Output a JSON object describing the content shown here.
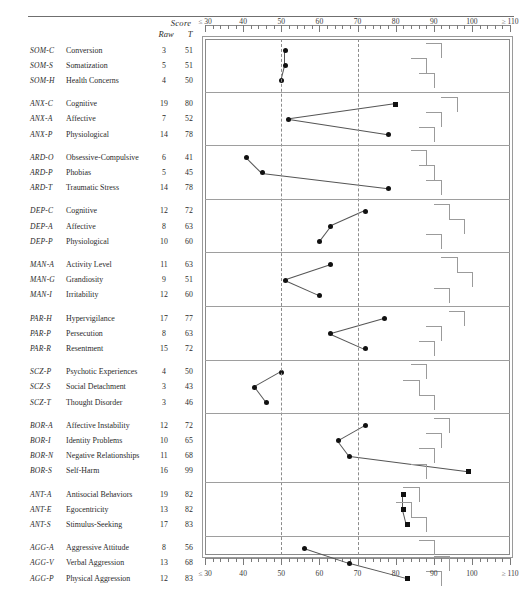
{
  "header": {
    "score_label": "Score",
    "raw_label": "Raw",
    "t_label": "T"
  },
  "axis": {
    "ticks": [
      {
        "label": "≤ 30",
        "value": 30
      },
      {
        "label": "40",
        "value": 40
      },
      {
        "label": "50",
        "value": 50
      },
      {
        "label": "60",
        "value": 60
      },
      {
        "label": "70",
        "value": 70
      },
      {
        "label": "80",
        "value": 80
      },
      {
        "label": "90",
        "value": 90
      },
      {
        "label": "100",
        "value": 100
      },
      {
        "label": "≥ 110",
        "value": 110
      }
    ],
    "reference_lines": [
      50,
      70
    ],
    "min": 30,
    "max": 110
  },
  "chart_data": {
    "type": "line",
    "xlabel": "T score",
    "ylabel": "",
    "xlim": [
      30,
      110
    ],
    "grid": true,
    "legend": "none",
    "marker_rule": "circle below T=80, square at or above T=80",
    "categories": [
      "Conversion",
      "Somatization",
      "Health Concerns",
      "Cognitive",
      "Affective",
      "Physiological",
      "Obsessive-Compulsive",
      "Phobias",
      "Traumatic Stress",
      "Cognitive",
      "Affective",
      "Physiological",
      "Activity Level",
      "Grandiosity",
      "Irritability",
      "Hypervigilance",
      "Persecution",
      "Resentment",
      "Psychotic Experiences",
      "Social Detachment",
      "Thought Disorder",
      "Affective Instability",
      "Identity Problems",
      "Negative Relationships",
      "Self-Harm",
      "Antisocial Behaviors",
      "Egocentricity",
      "Stimulus-Seeking",
      "Aggressive Attitude",
      "Verbal Aggression",
      "Physical Aggression"
    ],
    "values": [
      51,
      51,
      50,
      80,
      52,
      78,
      41,
      45,
      78,
      72,
      63,
      60,
      63,
      51,
      60,
      77,
      63,
      72,
      50,
      43,
      46,
      72,
      65,
      68,
      99,
      82,
      82,
      83,
      56,
      68,
      83
    ],
    "raw_values": [
      3,
      5,
      4,
      19,
      7,
      14,
      6,
      5,
      14,
      12,
      8,
      10,
      11,
      9,
      12,
      17,
      8,
      15,
      4,
      3,
      3,
      12,
      10,
      11,
      16,
      19,
      13,
      17,
      8,
      13,
      12
    ],
    "groups": [
      {
        "group_code": "SOM",
        "rows": [
          {
            "code": "SOM-C",
            "name": "Conversion",
            "raw": 3,
            "t": 51
          },
          {
            "code": "SOM-S",
            "name": "Somatization",
            "raw": 5,
            "t": 51
          },
          {
            "code": "SOM-H",
            "name": "Health Concerns",
            "raw": 4,
            "t": 50
          }
        ]
      },
      {
        "group_code": "ANX",
        "rows": [
          {
            "code": "ANX-C",
            "name": "Cognitive",
            "raw": 19,
            "t": 80
          },
          {
            "code": "ANX-A",
            "name": "Affective",
            "raw": 7,
            "t": 52
          },
          {
            "code": "ANX-P",
            "name": "Physiological",
            "raw": 14,
            "t": 78
          }
        ]
      },
      {
        "group_code": "ARD",
        "rows": [
          {
            "code": "ARD-O",
            "name": "Obsessive-Compulsive",
            "raw": 6,
            "t": 41
          },
          {
            "code": "ARD-P",
            "name": "Phobias",
            "raw": 5,
            "t": 45
          },
          {
            "code": "ARD-T",
            "name": "Traumatic Stress",
            "raw": 14,
            "t": 78
          }
        ]
      },
      {
        "group_code": "DEP",
        "rows": [
          {
            "code": "DEP-C",
            "name": "Cognitive",
            "raw": 12,
            "t": 72
          },
          {
            "code": "DEP-A",
            "name": "Affective",
            "raw": 8,
            "t": 63
          },
          {
            "code": "DEP-P",
            "name": "Physiological",
            "raw": 10,
            "t": 60
          }
        ]
      },
      {
        "group_code": "MAN",
        "rows": [
          {
            "code": "MAN-A",
            "name": "Activity Level",
            "raw": 11,
            "t": 63
          },
          {
            "code": "MAN-G",
            "name": "Grandiosity",
            "raw": 9,
            "t": 51
          },
          {
            "code": "MAN-I",
            "name": "Irritability",
            "raw": 12,
            "t": 60
          }
        ]
      },
      {
        "group_code": "PAR",
        "rows": [
          {
            "code": "PAR-H",
            "name": "Hypervigilance",
            "raw": 17,
            "t": 77
          },
          {
            "code": "PAR-P",
            "name": "Persecution",
            "raw": 8,
            "t": 63
          },
          {
            "code": "PAR-R",
            "name": "Resentment",
            "raw": 15,
            "t": 72
          }
        ]
      },
      {
        "group_code": "SCZ",
        "rows": [
          {
            "code": "SCZ-P",
            "name": "Psychotic Experiences",
            "raw": 4,
            "t": 50
          },
          {
            "code": "SCZ-S",
            "name": "Social Detachment",
            "raw": 3,
            "t": 43
          },
          {
            "code": "SCZ-T",
            "name": "Thought Disorder",
            "raw": 3,
            "t": 46
          }
        ]
      },
      {
        "group_code": "BOR",
        "rows": [
          {
            "code": "BOR-A",
            "name": "Affective Instability",
            "raw": 12,
            "t": 72
          },
          {
            "code": "BOR-I",
            "name": "Identity Problems",
            "raw": 10,
            "t": 65
          },
          {
            "code": "BOR-N",
            "name": "Negative Relationships",
            "raw": 11,
            "t": 68
          },
          {
            "code": "BOR-S",
            "name": "Self-Harm",
            "raw": 16,
            "t": 99
          }
        ]
      },
      {
        "group_code": "ANT",
        "rows": [
          {
            "code": "ANT-A",
            "name": "Antisocial Behaviors",
            "raw": 19,
            "t": 82
          },
          {
            "code": "ANT-E",
            "name": "Egocentricity",
            "raw": 13,
            "t": 82
          },
          {
            "code": "ANT-S",
            "name": "Stimulus-Seeking",
            "raw": 17,
            "t": 83
          }
        ]
      },
      {
        "group_code": "AGG",
        "rows": [
          {
            "code": "AGG-A",
            "name": "Aggressive Attitude",
            "raw": 8,
            "t": 56
          },
          {
            "code": "AGG-V",
            "name": "Verbal Aggression",
            "raw": 13,
            "t": 68
          },
          {
            "code": "AGG-P",
            "name": "Physical Aggression",
            "raw": 12,
            "t": 83
          }
        ]
      }
    ]
  }
}
